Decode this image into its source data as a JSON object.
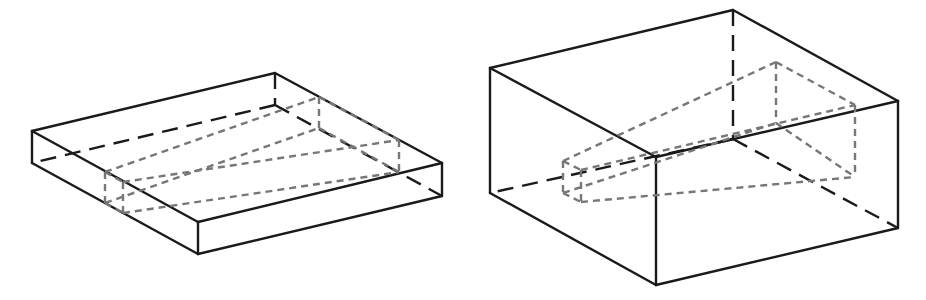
{
  "figure": {
    "colors": {
      "outline": "#1a1a1a",
      "inner_dashed": "#777777",
      "background": "#ffffff"
    },
    "panels": [
      {
        "id": "left",
        "label": "thin slab box with inner wedge",
        "box": {
          "top_left": [
            32,
            131
          ],
          "top_back": [
            275,
            73
          ],
          "top_right": [
            442,
            163
          ],
          "top_front": [
            198,
            222
          ],
          "bottom_left": [
            32,
            163
          ],
          "bottom_front": [
            198,
            254
          ],
          "bottom_right": [
            442,
            196
          ],
          "bottom_back_hidden": [
            275,
            105
          ]
        },
        "wedge": {
          "small_top_left": [
            105,
            172
          ],
          "small_bottom_left": [
            105,
            203
          ],
          "small_top_right": [
            123,
            182
          ],
          "small_bottom_right": [
            123,
            213
          ],
          "big_top_back": [
            319,
            97
          ],
          "big_bottom_back": [
            319,
            128
          ],
          "big_top_front": [
            399,
            140
          ],
          "big_bottom_front": [
            399,
            172
          ]
        }
      },
      {
        "id": "right",
        "label": "tall box with inner wedge",
        "box": {
          "top_left": [
            490,
            68
          ],
          "top_back": [
            733,
            10
          ],
          "top_right": [
            898,
            101
          ],
          "top_front": [
            656,
            157
          ],
          "bottom_left": [
            490,
            193
          ],
          "bottom_front": [
            656,
            285
          ],
          "bottom_right": [
            898,
            228
          ],
          "bottom_back_hidden": [
            733,
            139
          ]
        },
        "wedge": {
          "small_top_left": [
            563,
            161
          ],
          "small_bottom_left": [
            563,
            193
          ],
          "small_top_right": [
            581,
            170
          ],
          "small_bottom_right": [
            581,
            202
          ],
          "big_top_back": [
            776,
            62
          ],
          "big_bottom_back": [
            776,
            123
          ],
          "big_top_front": [
            855,
            105
          ],
          "big_bottom_front": [
            855,
            177
          ]
        }
      }
    ]
  }
}
